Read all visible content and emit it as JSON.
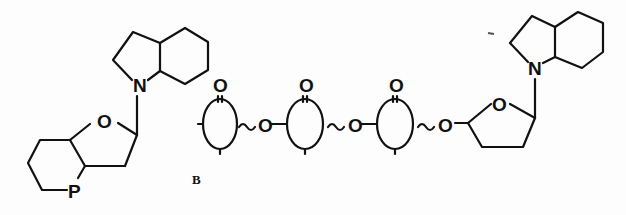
{
  "diagram": {
    "type": "chemical-structure",
    "label": "B",
    "left_unit": {
      "amine_atom": "N",
      "ring_oxygen": "O",
      "phosphorus_atom": "P"
    },
    "linker": {
      "ring_units": [
        {
          "carbonyl": "O"
        },
        {
          "carbonyl": "O"
        },
        {
          "carbonyl": "O"
        }
      ],
      "bridge_oxygens": [
        "O",
        "O",
        "O"
      ]
    },
    "right_unit": {
      "amine_atom": "N",
      "ring_oxygen": "O"
    },
    "colors": {
      "ink": "#111111",
      "background": "#fdfdfd"
    }
  }
}
